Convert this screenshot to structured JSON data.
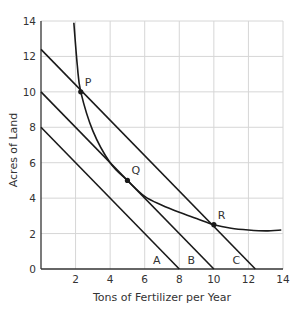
{
  "chart_data": {
    "type": "line",
    "title": "",
    "xlabel": "Tons of Fertilizer per Year",
    "ylabel": "Acres of Land",
    "xlim": [
      0,
      14
    ],
    "ylim": [
      0,
      14
    ],
    "xticks": [
      2,
      4,
      6,
      8,
      10,
      12,
      14
    ],
    "yticks": [
      0,
      2,
      4,
      6,
      8,
      10,
      12,
      14
    ],
    "grid": true,
    "series": [
      {
        "name": "A",
        "kind": "isocost",
        "points": [
          [
            0,
            8
          ],
          [
            8,
            0
          ]
        ]
      },
      {
        "name": "B",
        "kind": "isocost",
        "points": [
          [
            0,
            10
          ],
          [
            10,
            0
          ]
        ]
      },
      {
        "name": "C",
        "kind": "isocost",
        "points": [
          [
            0,
            12.4
          ],
          [
            12.4,
            0
          ]
        ]
      },
      {
        "name": "isoquant",
        "kind": "curve",
        "points": [
          [
            1.9,
            13.9
          ],
          [
            2.1,
            11.5
          ],
          [
            2.3,
            10
          ],
          [
            3,
            7.8
          ],
          [
            4,
            6
          ],
          [
            5,
            5
          ],
          [
            6,
            4.1
          ],
          [
            7,
            3.6
          ],
          [
            8,
            3.2
          ],
          [
            9,
            2.85
          ],
          [
            10,
            2.5
          ],
          [
            11,
            2.3
          ],
          [
            12,
            2.2
          ],
          [
            13,
            2.15
          ],
          [
            13.9,
            2.2
          ]
        ]
      }
    ],
    "points": [
      {
        "label": "P",
        "x": 2.3,
        "y": 10
      },
      {
        "label": "Q",
        "x": 5,
        "y": 5
      },
      {
        "label": "R",
        "x": 10,
        "y": 2.5
      }
    ],
    "line_labels": [
      {
        "label": "A",
        "x": 6.7,
        "y": 0.5
      },
      {
        "label": "B",
        "x": 8.7,
        "y": 0.5
      },
      {
        "label": "C",
        "x": 11.3,
        "y": 0.5
      }
    ],
    "legend": null
  },
  "colors": {
    "line": "#1a1a1a",
    "grid": "#d6d6d6",
    "axis": "#333333",
    "text": "#333333"
  }
}
